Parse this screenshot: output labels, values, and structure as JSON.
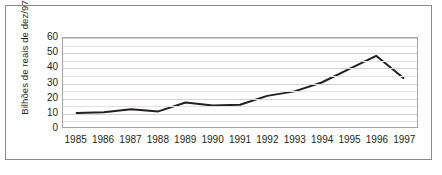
{
  "chart_data": {
    "type": "line",
    "title": "",
    "xlabel": "",
    "ylabel": "Bilhões de reais de dez/97",
    "categories": [
      "1985",
      "1986",
      "1987",
      "1988",
      "1989",
      "1990",
      "1991",
      "1992",
      "1993",
      "1994",
      "1995",
      "1996",
      "1997"
    ],
    "values": [
      9.5,
      10,
      12,
      10.5,
      16.5,
      14.5,
      15,
      21,
      24,
      30,
      39,
      48,
      33
    ],
    "yticks": [
      "0",
      "10",
      "20",
      "30",
      "40",
      "50",
      "60"
    ],
    "ytick_values": [
      0,
      10,
      20,
      30,
      40,
      50,
      60
    ],
    "ylim": [
      0,
      60
    ],
    "grid": true,
    "grid_interval": 5,
    "legend": "none",
    "series_color": "#231f20",
    "grid_color": "#e2e2e2",
    "axis_color": "#a6a6a6",
    "border_color": "#8a8a8a",
    "text_color": "#231f20"
  }
}
